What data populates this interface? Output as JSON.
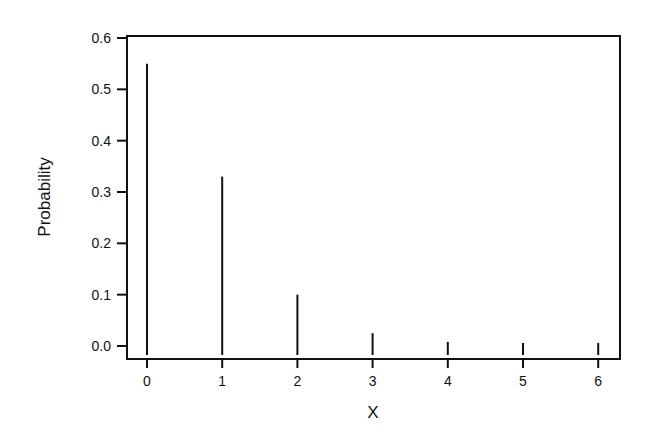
{
  "chart_data": {
    "type": "bar",
    "subtype": "probability-mass-function (stem/spike plot)",
    "title": "",
    "xlabel": "X",
    "ylabel": "Probability",
    "categories": [
      "0",
      "1",
      "2",
      "3",
      "4",
      "5",
      "6"
    ],
    "x": [
      0,
      1,
      2,
      3,
      4,
      5,
      6
    ],
    "values": [
      0.55,
      0.33,
      0.1,
      0.025,
      0.008,
      0.006,
      0.006
    ],
    "ylim": [
      0.0,
      0.6
    ],
    "yticks": [
      "0.0",
      "0.1",
      "0.2",
      "0.3",
      "0.4",
      "0.5",
      "0.6"
    ],
    "xticks": [
      "0",
      "1",
      "2",
      "3",
      "4",
      "5",
      "6"
    ],
    "grid": false,
    "legend": null,
    "frame": "box"
  },
  "colors": {
    "background": "#ffffff",
    "ink": "#111111"
  }
}
